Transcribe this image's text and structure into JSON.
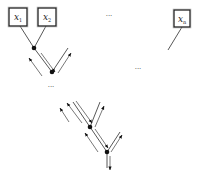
{
  "diagram": {
    "type": "factor-tree message passing",
    "variables": [
      {
        "id": "x1",
        "base": "x",
        "sub": "1",
        "box": {
          "x": 9,
          "y": 8,
          "w": 18,
          "h": 18
        }
      },
      {
        "id": "x2",
        "base": "x",
        "sub": "2",
        "box": {
          "x": 38,
          "y": 8,
          "w": 18,
          "h": 18
        }
      },
      {
        "id": "xn",
        "base": "x",
        "sub": "n",
        "box": {
          "x": 174,
          "y": 10,
          "w": 16,
          "h": 17
        }
      }
    ],
    "ellipses": [
      {
        "id": "ellipsis-top",
        "text": "···",
        "x": 109,
        "y": 18
      },
      {
        "id": "ellipsis-right",
        "text": "···",
        "x": 138,
        "y": 71
      },
      {
        "id": "ellipsis-mid",
        "text": "···",
        "x": 51,
        "y": 89
      }
    ],
    "nodes": [
      {
        "id": "n1",
        "x": 34,
        "y": 48
      },
      {
        "id": "n2",
        "x": 52,
        "y": 72
      },
      {
        "id": "n3",
        "x": 90,
        "y": 127
      },
      {
        "id": "n4",
        "x": 107,
        "y": 152
      }
    ],
    "edges": [
      {
        "from": [
          20,
          26
        ],
        "to": [
          34,
          48
        ]
      },
      {
        "from": [
          46,
          26
        ],
        "to": [
          34,
          48
        ]
      },
      {
        "from": [
          34,
          48
        ],
        "to": [
          52,
          72
        ]
      },
      {
        "from": [
          52,
          72
        ],
        "to": [
          68,
          48
        ]
      },
      {
        "from": [
          182,
          27
        ],
        "to": [
          168,
          50
        ]
      },
      {
        "from": [
          73,
          102
        ],
        "to": [
          90,
          127
        ]
      },
      {
        "from": [
          100,
          102
        ],
        "to": [
          90,
          127
        ]
      },
      {
        "from": [
          90,
          127
        ],
        "to": [
          107,
          152
        ]
      },
      {
        "from": [
          107,
          152
        ],
        "to": [
          120,
          132
        ]
      },
      {
        "from": [
          107,
          152
        ],
        "to": [
          107,
          168
        ]
      }
    ],
    "messages": [
      {
        "from": [
          41,
          53
        ],
        "to": [
          55,
          72
        ],
        "direction": "down-right"
      },
      {
        "from": [
          58,
          73
        ],
        "to": [
          71,
          53
        ],
        "direction": "up-right"
      },
      {
        "from": [
          42,
          76
        ],
        "to": [
          29,
          58
        ],
        "direction": "up-left"
      },
      {
        "from": [
          76,
          101
        ],
        "to": [
          92,
          123
        ],
        "direction": "down-right"
      },
      {
        "from": [
          69,
          122
        ],
        "to": [
          60,
          108
        ],
        "direction": "up-left",
        "outer": true
      },
      {
        "from": [
          82,
          123
        ],
        "to": [
          67,
          103
        ],
        "direction": "up-left"
      },
      {
        "from": [
          95,
          127
        ],
        "to": [
          104,
          106
        ],
        "direction": "up-right"
      },
      {
        "from": [
          95,
          129
        ],
        "to": [
          108,
          148
        ],
        "direction": "down-right"
      },
      {
        "from": [
          98,
          152
        ],
        "to": [
          85,
          133
        ],
        "direction": "up-left"
      },
      {
        "from": [
          111,
          152
        ],
        "to": [
          122,
          135
        ],
        "direction": "up-right"
      },
      {
        "from": [
          110,
          156
        ],
        "to": [
          110,
          170
        ],
        "direction": "down"
      }
    ]
  }
}
